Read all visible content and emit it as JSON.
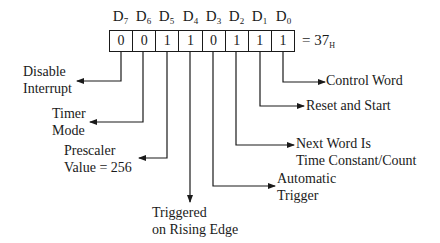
{
  "diagram": {
    "register": {
      "bit_labels": [
        {
          "main": "D",
          "sub": "7"
        },
        {
          "main": "D",
          "sub": "6"
        },
        {
          "main": "D",
          "sub": "5"
        },
        {
          "main": "D",
          "sub": "4"
        },
        {
          "main": "D",
          "sub": "3"
        },
        {
          "main": "D",
          "sub": "2"
        },
        {
          "main": "D",
          "sub": "1"
        },
        {
          "main": "D",
          "sub": "0"
        }
      ],
      "bit_values": [
        "0",
        "0",
        "1",
        "1",
        "0",
        "1",
        "1",
        "1"
      ],
      "equals": "= 37",
      "hex_suffix": "H"
    },
    "annotations": [
      {
        "bit": "D7",
        "line1": "Disable",
        "line2": "Interrupt"
      },
      {
        "bit": "D6",
        "line1": "Timer",
        "line2": "Mode"
      },
      {
        "bit": "D5",
        "line1": "Prescaler",
        "line2": "Value = 256"
      },
      {
        "bit": "D4",
        "line1": "Triggered",
        "line2": "on Rising Edge"
      },
      {
        "bit": "D3",
        "line1": "Automatic",
        "line2": "Trigger"
      },
      {
        "bit": "D2",
        "line1": "Next Word Is",
        "line2": "Time Constant/Count"
      },
      {
        "bit": "D1",
        "line1": "Reset and Start",
        "line2": ""
      },
      {
        "bit": "D0",
        "line1": "Control Word",
        "line2": ""
      }
    ],
    "line_color": "#1a1a1a"
  }
}
